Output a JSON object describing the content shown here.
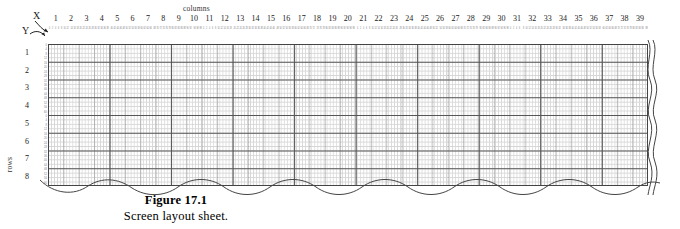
{
  "figure": {
    "number": "Figure 17.1",
    "caption": "Screen layout sheet.",
    "columns_label": "columns",
    "rows_label": "rows",
    "x_axis_letter": "X",
    "y_axis_letter": "Y"
  },
  "grid": {
    "column_count": 39,
    "row_count": 8,
    "columns": [
      1,
      2,
      3,
      4,
      5,
      6,
      7,
      8,
      9,
      10,
      11,
      12,
      13,
      14,
      15,
      16,
      17,
      18,
      19,
      20,
      21,
      22,
      23,
      24,
      25,
      26,
      27,
      28,
      29,
      30,
      31,
      32,
      33,
      34,
      35,
      36,
      37,
      38,
      39
    ],
    "rows": [
      1,
      2,
      3,
      4,
      5,
      6,
      7,
      8
    ],
    "column_subticks": [
      0,
      2,
      4,
      6,
      8
    ],
    "row_subticks": [
      0,
      4,
      8,
      12
    ],
    "row_scanline_labels": [
      [
        "0",
        "4",
        "8",
        "12"
      ],
      [
        "16",
        "20",
        "24",
        "28"
      ],
      [
        "32",
        "36",
        "40",
        "44"
      ],
      [
        "48",
        "52",
        "56",
        "60"
      ],
      [
        "0",
        "4",
        "8",
        "12"
      ],
      [
        "16",
        "20",
        "24",
        "28"
      ],
      [
        "32",
        "36",
        "40",
        "44"
      ],
      [
        "48",
        "52",
        "56",
        "60"
      ]
    ]
  },
  "colors": {
    "paper": "#ffffff",
    "major_line": "#555555",
    "minor_line": "#787878",
    "dot_grid": "#c9c9c9",
    "text": "#111111"
  }
}
